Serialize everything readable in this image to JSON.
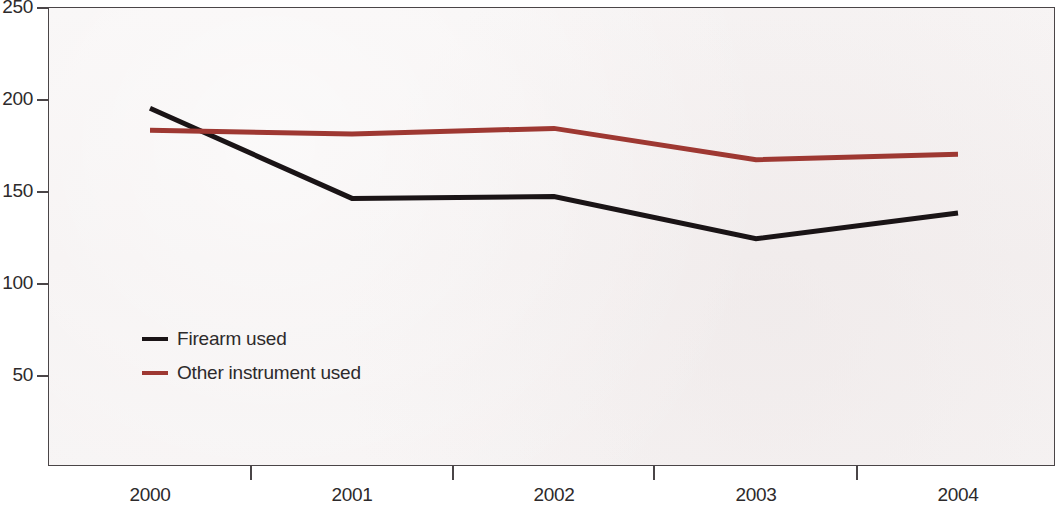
{
  "chart_data": {
    "type": "line",
    "title": "",
    "subtitle": "",
    "xlabel": "",
    "ylabel": "",
    "categories": [
      "2000",
      "2001",
      "2002",
      "2003",
      "2004"
    ],
    "series": [
      {
        "name": "Firearm used",
        "color": "#1a1416",
        "values": [
          195,
          146,
          147,
          124,
          138
        ]
      },
      {
        "name": "Other instrument used",
        "color": "#9e3832",
        "values": [
          183,
          181,
          184,
          167,
          170
        ]
      }
    ],
    "ylim": [
      0,
      250
    ],
    "yticks": [
      50,
      100,
      150,
      200,
      250
    ],
    "ytick_labels": [
      "50",
      "100",
      "150",
      "200",
      "250"
    ],
    "xtick_labels": [
      "2000",
      "2001",
      "2002",
      "2003",
      "2004"
    ],
    "grid": false,
    "legend_position": "inside-lower-left",
    "plot_background": "#f6f3f3",
    "axis_color": "#4a4547"
  },
  "legend": {
    "entries": [
      {
        "label": "Firearm used",
        "color": "#1a1416",
        "swatch": "line-swatch-black"
      },
      {
        "label": "Other instrument used",
        "color": "#9e3832",
        "swatch": "line-swatch-red"
      }
    ]
  },
  "axis": {
    "y_labels": [
      "250",
      "200",
      "150",
      "100",
      "50"
    ],
    "x_labels": [
      "2000",
      "2001",
      "2002",
      "2003",
      "2004"
    ]
  }
}
